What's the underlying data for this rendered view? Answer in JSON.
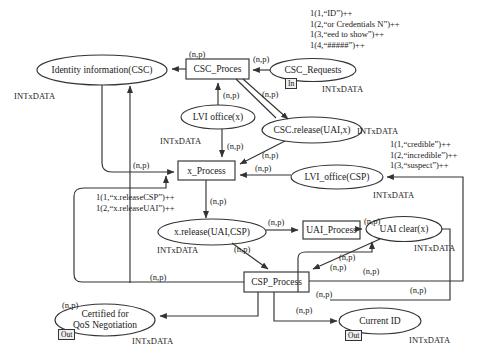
{
  "diagram": {
    "colors": {
      "stroke": "#333333",
      "text": "#1a1a1a",
      "port_fill": "#efefef"
    }
  },
  "places": [
    {
      "id": "identity-information",
      "label": "Identity information(CSC)",
      "type_label": "INTxDATA"
    },
    {
      "id": "csc-requests",
      "label": "CSC_Requests",
      "type_label": "INTxDATA",
      "port": "In"
    },
    {
      "id": "lvi-office-x",
      "label": "LVI office(x)",
      "type_label": "INTxDATA"
    },
    {
      "id": "csc-release-uai-x",
      "label": "CSC.release(UAI,x)",
      "type_label": "INTxDATA"
    },
    {
      "id": "lvi-office-csp",
      "label": "LVI_office(CSP)",
      "type_label": "INTxDATA"
    },
    {
      "id": "x-release-uai-csp",
      "label": "x.release(UAI,CSP)",
      "type_label": "INTxDATA"
    },
    {
      "id": "uai-clear-x",
      "label": "UAI clear(x)",
      "type_label": "INTxDATA"
    },
    {
      "id": "certified-qos",
      "label_line1": "Certified for",
      "label_line2": "QoS Negotiation",
      "type_label": "INTxDATA",
      "port": "Out"
    },
    {
      "id": "current-id",
      "label": "Current ID",
      "type_label": "INTxDATA",
      "port": "Out"
    }
  ],
  "transitions": [
    {
      "id": "csc-proces",
      "label": "CSC_Proces"
    },
    {
      "id": "x-process",
      "label": "x_Process"
    },
    {
      "id": "uai-process",
      "label": "UAI_Process"
    },
    {
      "id": "csp-process",
      "label": "CSP_Process"
    }
  ],
  "initial_markings": [
    {
      "id": "csc-requests-marking",
      "lines": [
        "1(1,“ID”)++",
        "1(2,“or Credentials N”)++",
        "1(3,“eed to show”)++",
        "1(4,“#####”)++"
      ]
    },
    {
      "id": "lvi-office-csp-marking",
      "lines": [
        "1(1,“credible”)++",
        "1(2,“incredible”)++",
        "1(3,“suspect”)++"
      ]
    },
    {
      "id": "x-process-marking",
      "lines": [
        "1(1,“x.releaseCSP”)++",
        "1(2,“x.releaseUAI”)++"
      ]
    }
  ],
  "arc_inscription": "(n,p)",
  "arc_labels": [
    {
      "id": "arc-cscproces-to-identity",
      "text": "(n,p)"
    },
    {
      "id": "arc-cscrequests-to-cscproces",
      "text": "(n,p)"
    },
    {
      "id": "arc-cscproces-to-lvioffice",
      "text": "(n,p)"
    },
    {
      "id": "arc-cscproces-to-cscrelease",
      "text": "(n,p)"
    },
    {
      "id": "arc-lvioffice-to-xprocess",
      "text": "(n,p)"
    },
    {
      "id": "arc-cscrelease-to-xprocess",
      "text": "(n,p)"
    },
    {
      "id": "arc-left-rail-to-xprocess",
      "text": "(n,p)"
    },
    {
      "id": "arc-lviofficecsp-to-xprocess",
      "text": "(n,p)"
    },
    {
      "id": "arc-xprocess-to-xrelease",
      "text": "(n,p)"
    },
    {
      "id": "arc-xrelease-to-uaiprocess",
      "text": "(n,p)"
    },
    {
      "id": "arc-uaiprocess-to-uaiclear",
      "text": "(n,p)"
    },
    {
      "id": "arc-xrelease-to-cspprocess",
      "text": "(n,p)"
    },
    {
      "id": "arc-uaiclear-to-cspprocess",
      "text": "(n,p)"
    },
    {
      "id": "arc-right-rail-to-cspprocess",
      "text": "(n,p)"
    },
    {
      "id": "arc-leftrail-to-cspprocess",
      "text": "(n,p)"
    },
    {
      "id": "arc-cspprocess-to-certified",
      "text": "(n,p)"
    },
    {
      "id": "arc-cspprocess-to-currentid",
      "text": "(n,p)"
    },
    {
      "id": "arc-cspprocess-right-out",
      "text": "(n,p)"
    },
    {
      "id": "arc-cspprocess-to-uaiclear-return",
      "text": "(n,p)"
    },
    {
      "id": "arc-cspprocess-feedback-left",
      "text": "(n,p)"
    }
  ]
}
